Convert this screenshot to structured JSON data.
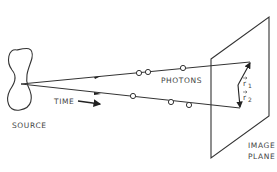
{
  "diagram": {
    "type": "photon-path illustration",
    "labels": {
      "source": "SOURCE",
      "time": "TIME",
      "photons": "PHOTONS",
      "image_plane_line1": "IMAGE",
      "image_plane_line2": "PLANE",
      "r1": "r",
      "r1_sub": "1",
      "r2": "r",
      "r2_sub": "2"
    },
    "colors": {
      "stroke": "#333333",
      "text": "#444444",
      "background": "#ffffff"
    }
  }
}
